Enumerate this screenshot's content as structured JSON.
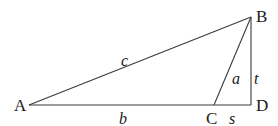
{
  "diagram": {
    "type": "triangle-geometry",
    "vertices": [
      {
        "id": "A",
        "label": "A",
        "x": 29,
        "y": 105
      },
      {
        "id": "B",
        "label": "B",
        "x": 251,
        "y": 17
      },
      {
        "id": "C",
        "label": "C",
        "x": 214,
        "y": 105
      },
      {
        "id": "D",
        "label": "D",
        "x": 251,
        "y": 105
      }
    ],
    "edges": [
      {
        "from": "A",
        "to": "B",
        "label": "c"
      },
      {
        "from": "A",
        "to": "C",
        "label": "b"
      },
      {
        "from": "C",
        "to": "B",
        "label": "a"
      },
      {
        "from": "B",
        "to": "D",
        "label": "t"
      },
      {
        "from": "C",
        "to": "D",
        "label": "s"
      }
    ],
    "colors": {
      "line": "#3a3a3a",
      "text": "#1a1a1a",
      "background": "#ffffff"
    }
  }
}
